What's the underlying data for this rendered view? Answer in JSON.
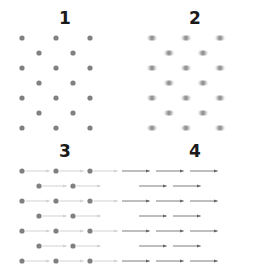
{
  "figure": {
    "title": "",
    "background_color": "#ffffff",
    "width": 260,
    "height": 266,
    "rows": 2,
    "cols": 2
  },
  "panels": [
    {
      "label": "1",
      "name": "panel-dots",
      "style": "dots",
      "description": "Sharp gray dots on a triangular lattice",
      "dot_color": "#808080",
      "dot_radius": 2.6,
      "arrow_color": "",
      "arrow_opacity": 0,
      "blur": 0
    },
    {
      "label": "2",
      "name": "panel-blurred-dots",
      "style": "blurred-dots",
      "description": "Same lattice with horizontally smeared, blurred dots",
      "dot_color": "#8a8a8a",
      "dot_radius": 2.8,
      "arrow_color": "",
      "arrow_opacity": 0,
      "blur": 1.6
    },
    {
      "label": "3",
      "name": "panel-dots-with-faint-arrows",
      "style": "dots-with-arrows",
      "description": "Lattice dots with faint rightward arrows attached",
      "dot_color": "#808080",
      "dot_radius": 2.6,
      "arrow_color": "#b9b9b9",
      "arrow_opacity": 0.75,
      "blur": 0
    },
    {
      "label": "4",
      "name": "panel-arrows",
      "style": "arrows",
      "description": "Rightward arrows only, arrowheads at the lattice points",
      "dot_color": "",
      "dot_radius": 0,
      "arrow_color": "#666666",
      "arrow_opacity": 1,
      "blur": 0
    }
  ],
  "chart_data": {
    "type": "scatter",
    "title": "",
    "subtitle": "",
    "xlabel": "",
    "ylabel": "",
    "xlim": [
      0,
      130
    ],
    "ylim": [
      0,
      107
    ],
    "grid": false,
    "legend": null,
    "lattice": {
      "description": "Triangular (hexagonal) lattice: 7 rows, alternating 3 and 2 points per row",
      "row_spacing": 14.5,
      "col_spacing": 34,
      "row_offset": 17,
      "points_per_row": [
        3,
        2,
        3,
        2,
        3,
        2,
        3
      ],
      "first_row_y": 12,
      "odd_row_x": [
        22,
        56,
        90
      ],
      "even_row_x": [
        39,
        73
      ]
    },
    "points": [
      {
        "x": 22,
        "y": 12
      },
      {
        "x": 56,
        "y": 12
      },
      {
        "x": 90,
        "y": 12
      },
      {
        "x": 39,
        "y": 27
      },
      {
        "x": 73,
        "y": 27
      },
      {
        "x": 22,
        "y": 42
      },
      {
        "x": 56,
        "y": 42
      },
      {
        "x": 90,
        "y": 42
      },
      {
        "x": 39,
        "y": 57
      },
      {
        "x": 73,
        "y": 57
      },
      {
        "x": 22,
        "y": 72
      },
      {
        "x": 56,
        "y": 72
      },
      {
        "x": 90,
        "y": 72
      },
      {
        "x": 39,
        "y": 87
      },
      {
        "x": 73,
        "y": 87
      },
      {
        "x": 22,
        "y": 102
      },
      {
        "x": 56,
        "y": 102
      },
      {
        "x": 90,
        "y": 102
      }
    ],
    "vectors": {
      "direction": "right",
      "dx": 30,
      "dy": 0,
      "note": "Every lattice point carries an identical rightward displacement vector"
    }
  }
}
